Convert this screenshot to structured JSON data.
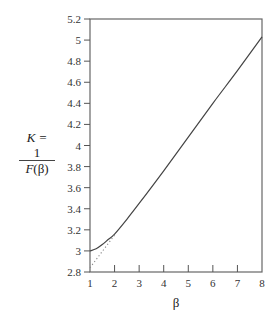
{
  "chart_data": {
    "type": "line",
    "title": "",
    "xlabel": "β",
    "ylabel": {
      "line1": "K =",
      "numerator": "1",
      "denominator_fn": "F",
      "denominator_arg": "(β)"
    },
    "xlim": [
      1,
      8
    ],
    "ylim": [
      2.8,
      5.2
    ],
    "x_ticks": [
      "1",
      "2",
      "3",
      "4",
      "5",
      "6",
      "7",
      "8"
    ],
    "x_tick_values": [
      1,
      2,
      3,
      4,
      5,
      6,
      7,
      8
    ],
    "y_ticks": [
      "2.8",
      "3",
      "3.2",
      "3.4",
      "3.6",
      "3.8",
      "4",
      "4.2",
      "4.4",
      "4.6",
      "4.8",
      "5",
      "5.2"
    ],
    "y_tick_values": [
      2.8,
      3.0,
      3.2,
      3.4,
      3.6,
      3.8,
      4.0,
      4.2,
      4.4,
      4.6,
      4.8,
      5.0,
      5.2
    ],
    "grid": false,
    "legend": "none",
    "series": [
      {
        "name": "K = 1/F(β)",
        "style": "solid",
        "x": [
          1,
          1.25,
          1.5,
          1.75,
          2,
          2.5,
          3,
          4,
          5,
          6,
          7,
          8
        ],
        "y": [
          3.0,
          3.02,
          3.06,
          3.11,
          3.16,
          3.3,
          3.45,
          3.76,
          4.08,
          4.4,
          4.71,
          5.03
        ]
      },
      {
        "name": "asymptote",
        "style": "dotted",
        "x": [
          1,
          2
        ],
        "y": [
          2.84,
          3.15
        ]
      }
    ]
  }
}
